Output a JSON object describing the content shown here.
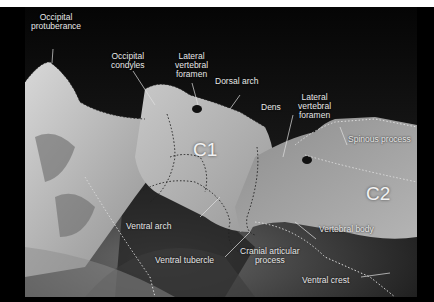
{
  "figure": {
    "type": "annotated radiograph",
    "vertebra_labels": {
      "c1": "C1",
      "c2": "C2"
    },
    "annotations": {
      "occipital_protuberance": [
        "Occipital",
        "protuberance"
      ],
      "occipital_condyles": [
        "Occipital",
        "condyles"
      ],
      "lateral_vertebral_foramen_c1": [
        "Lateral",
        "vertebral",
        "foramen"
      ],
      "dorsal_arch": "Dorsal arch",
      "dens": "Dens",
      "lateral_vertebral_foramen_c2": [
        "Lateral",
        "vertebral",
        "foramen"
      ],
      "spinous_process": "Spinous process",
      "ventral_arch": "Ventral arch",
      "ventral_tubercle": "Ventral tubercle",
      "cranial_articular_process": [
        "Cranial articular",
        "process"
      ],
      "vertebral_body": "Vertebral body",
      "ventral_crest": "Ventral crest"
    },
    "colors": {
      "background_frame": "#000000",
      "top_strip": "#ffffff",
      "label_text": "#e8e8e8",
      "outline_dots": "#222222",
      "outline_dots_light": "#dddddd"
    }
  }
}
